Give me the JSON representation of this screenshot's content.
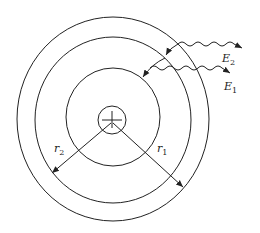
{
  "diagram": {
    "labels": {
      "e2": {
        "sym": "E",
        "sub": "2"
      },
      "e1": {
        "sym": "E",
        "sub": "1"
      },
      "r2": {
        "sym": "r",
        "sub": "2"
      },
      "r1": {
        "sym": "r",
        "sub": "1"
      }
    },
    "colors": {
      "stroke": "#222222",
      "background": "#ffffff"
    }
  }
}
